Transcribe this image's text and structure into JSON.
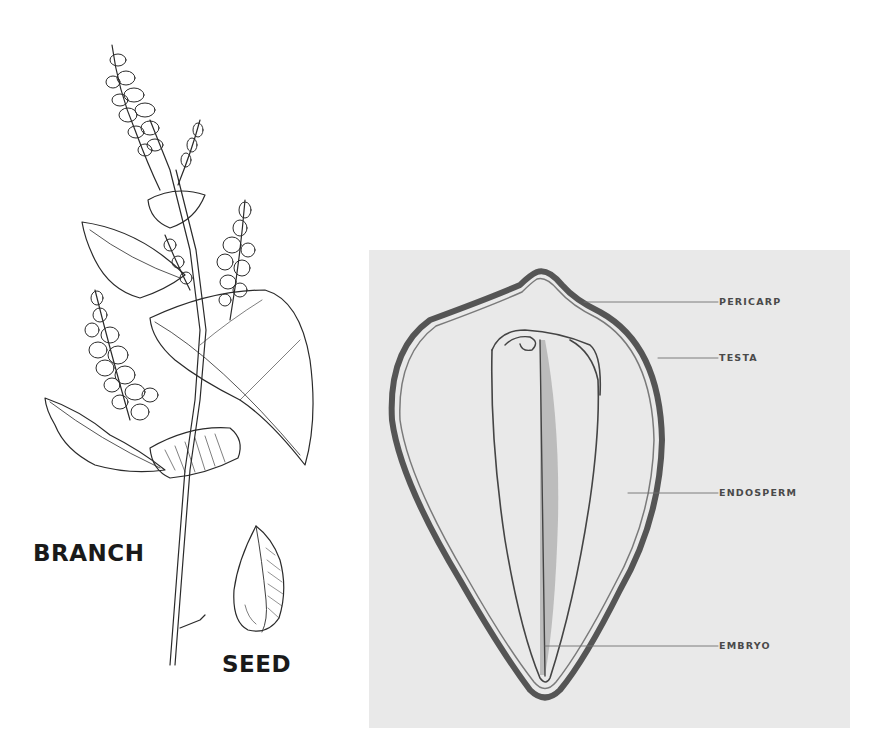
{
  "left_illustration": {
    "branch_label": "BRANCH",
    "seed_label": "SEED"
  },
  "cross_section": {
    "labels": {
      "pericarp": "PERICARP",
      "testa": "TESTA",
      "endosperm": "ENDOSPERM",
      "embryo": "EMBRYO"
    },
    "colors": {
      "panel_bg": "#e9e9e9",
      "outline": "#555555",
      "label": "#4a4a4a"
    }
  }
}
